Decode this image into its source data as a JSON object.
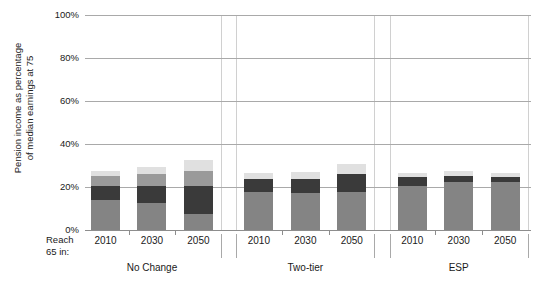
{
  "axis": {
    "y_title": "Pension income as percentage\nof median earnings at 75",
    "x_row_label": "Reach\n65 in:",
    "y_ticks": [
      "100%",
      "80%",
      "60%",
      "40%",
      "20%",
      "0%"
    ],
    "y_tick_values": [
      100,
      80,
      60,
      40,
      20,
      0
    ]
  },
  "colors": {
    "segment_base": "#848484",
    "segment_dark": "#3a3a3a",
    "segment_mid": "#9a9a9a",
    "segment_light": "#e0e0e0",
    "gridline": "#a9a9a9",
    "axis": "#8d8d8d",
    "text": "#1a1a1a",
    "background": "#ffffff"
  },
  "chart_data": {
    "type": "bar",
    "title": "",
    "xlabel": "",
    "ylabel": "Pension income as percentage of median earnings at 75",
    "ylim": [
      0,
      100
    ],
    "grid": true,
    "stacked": true,
    "legend": "none",
    "groups": [
      "No Change",
      "Two-tier",
      "ESP"
    ],
    "categories": [
      "2010",
      "2030",
      "2050",
      "2010",
      "2030",
      "2050",
      "2010",
      "2030",
      "2050"
    ],
    "series": [
      {
        "name": "segment-base",
        "values": [
          14.0,
          12.5,
          7.5,
          17.5,
          17.0,
          17.5,
          20.5,
          22.5,
          22.5
        ]
      },
      {
        "name": "segment-dark",
        "values": [
          6.5,
          8.0,
          13.0,
          6.0,
          6.5,
          8.5,
          4.0,
          2.5,
          2.0
        ]
      },
      {
        "name": "segment-mid",
        "values": [
          4.5,
          5.5,
          7.0,
          0.0,
          0.0,
          0.0,
          0.0,
          0.0,
          0.0
        ]
      },
      {
        "name": "segment-light",
        "values": [
          2.5,
          3.5,
          5.0,
          3.0,
          3.5,
          4.5,
          2.0,
          2.5,
          2.0
        ]
      }
    ],
    "totals": [
      27.5,
      29.5,
      32.5,
      26.5,
      27.0,
      30.5,
      26.5,
      27.5,
      26.5
    ]
  }
}
